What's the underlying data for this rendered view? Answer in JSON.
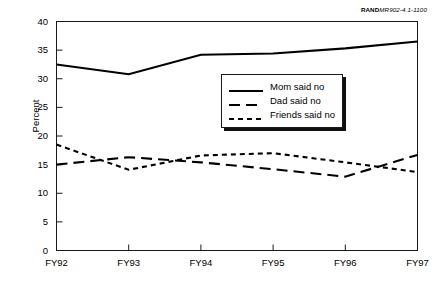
{
  "source_id": {
    "mark": "RAND",
    "number": "MR902-4.1-1100"
  },
  "chart_data": {
    "type": "line",
    "title": "",
    "xlabel": "",
    "ylabel": "Percent",
    "categories": [
      "FY92",
      "FY93",
      "FY94",
      "FY95",
      "FY96",
      "FY97"
    ],
    "ylim": [
      0,
      40
    ],
    "yticks": [
      0,
      5,
      10,
      15,
      20,
      25,
      30,
      35,
      40
    ],
    "grid": false,
    "legend_position": "center-right-inside",
    "series": [
      {
        "name": "Mom said no",
        "style": "solid",
        "values": [
          32.5,
          30.8,
          34.2,
          34.4,
          35.3,
          36.5
        ]
      },
      {
        "name": "Dad said no",
        "style": "long-dash",
        "values": [
          15.0,
          16.3,
          15.4,
          14.2,
          12.9,
          16.7
        ]
      },
      {
        "name": "Friends said no",
        "style": "short-dash",
        "values": [
          18.5,
          14.1,
          16.6,
          17.0,
          15.4,
          13.7
        ]
      }
    ]
  }
}
